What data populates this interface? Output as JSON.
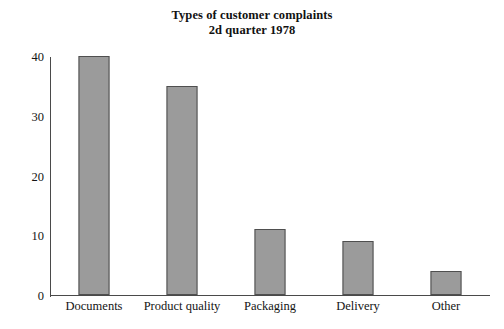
{
  "chart_data": {
    "type": "bar",
    "title": "Types of customer complaints",
    "subtitle": "2d quarter 1978",
    "xlabel": "",
    "ylabel": "",
    "categories": [
      "Documents",
      "Product quality",
      "Packaging",
      "Delivery",
      "Other"
    ],
    "values": [
      40,
      35,
      11,
      9,
      4
    ],
    "ylim": [
      0,
      40
    ],
    "yticks": [
      0,
      10,
      20,
      30,
      40
    ],
    "ytick_labels": [
      "0",
      "10",
      "20",
      "30",
      "40"
    ],
    "grid": false,
    "legend": null,
    "series": [
      {
        "name": "Complaints",
        "values": [
          40,
          35,
          11,
          9,
          4
        ]
      }
    ],
    "style": {
      "bar_fill": "#9b9b9b",
      "bar_border": "#4f4f4f",
      "axis_color": "#4a4a4a",
      "text_color": "#141414",
      "background": "#ffffff"
    }
  },
  "title_lines": [
    "Types of customer complaints",
    "2d quarter 1978"
  ]
}
